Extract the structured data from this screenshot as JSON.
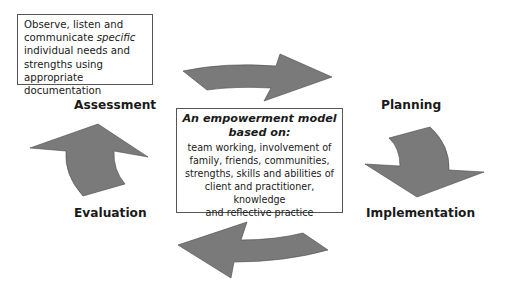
{
  "note": {
    "line1": "Observe, listen and",
    "line2_prefix": "communicate ",
    "line2_italic": "specific",
    "line3": "individual needs and",
    "line4": "strengths using appropriate",
    "line5": "documentation"
  },
  "center": {
    "title_line1": "An empowerment model",
    "title_line2": "based on:",
    "body_lines": [
      "team working, involvement of",
      "family, friends, communities,",
      "strengths, skills and abilities of",
      "client and practitioner, knowledge",
      "and reflective practice"
    ]
  },
  "stages": {
    "assessment": "Assessment",
    "planning": "Planning",
    "implementation": "Implementation",
    "evaluation": "Evaluation"
  },
  "colors": {
    "arrow_fill": "#7a7a7a",
    "arrow_stroke": "#4a4a4a",
    "box_border": "#555555"
  }
}
